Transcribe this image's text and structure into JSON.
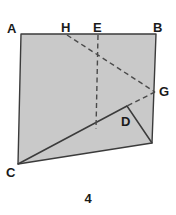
{
  "figure": {
    "caption": "4",
    "fill_color": "#c9c9c9",
    "stroke_color": "#3b3b3b",
    "dash_color": "#4a4a4a",
    "background_color": "#ffffff",
    "labels": {
      "a": "A",
      "h": "H",
      "e": "E",
      "b": "B",
      "g": "G",
      "d": "D",
      "c": "C"
    },
    "points": {
      "A": [
        21,
        34
      ],
      "H": [
        67,
        35
      ],
      "E": [
        98,
        35
      ],
      "B": [
        156,
        34
      ],
      "G": [
        155,
        92
      ],
      "D": [
        127,
        106
      ],
      "C": [
        18,
        164
      ],
      "F": [
        152,
        143
      ],
      "E_foot": [
        96,
        129
      ]
    },
    "shapes": {
      "quad_outline": "21,34 156,34 152,143 18,164",
      "triangle_cdf": "18,164 127,106 152,143",
      "line_c_to_d": "18,164 127,106",
      "line_d_to_f": "127,106 152,143",
      "dashed_h_to_g": "67,35 155,92",
      "dashed_g_to_d": "155,92 127,106",
      "dashed_e_vertical": "98,35 96,129"
    }
  }
}
